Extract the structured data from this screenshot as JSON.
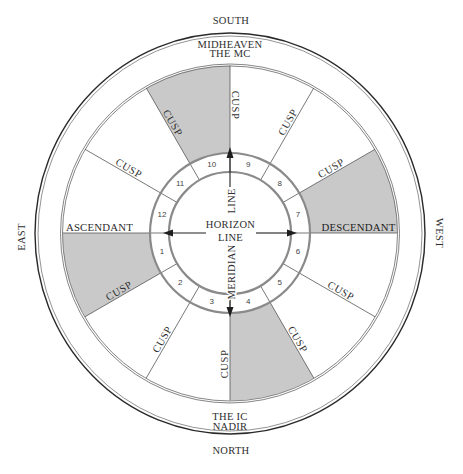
{
  "directions": {
    "south": "SOUTH",
    "north": "NORTH",
    "east": "EAST",
    "west": "WEST"
  },
  "angles": {
    "midheaven": "MIDHEAVEN",
    "the_mc": "THE MC",
    "the_ic": "THE IC",
    "nadir": "NADIR",
    "ascendant": "ASCENDANT",
    "descendant": "DESCENDANT"
  },
  "center": {
    "horizon_line_1": "HORIZON",
    "horizon_line_2": "LINE",
    "meridian_upper": "LINE",
    "meridian_lower": "MERIDIAN"
  },
  "houses": [
    {
      "number": "1",
      "shaded": true
    },
    {
      "number": "2",
      "shaded": false
    },
    {
      "number": "3",
      "shaded": false
    },
    {
      "number": "4",
      "shaded": true
    },
    {
      "number": "5",
      "shaded": false
    },
    {
      "number": "6",
      "shaded": false
    },
    {
      "number": "7",
      "shaded": true
    },
    {
      "number": "8",
      "shaded": false
    },
    {
      "number": "9",
      "shaded": false
    },
    {
      "number": "10",
      "shaded": true
    },
    {
      "number": "11",
      "shaded": false
    },
    {
      "number": "12",
      "shaded": false
    }
  ],
  "cusps": [
    {
      "position": "midheaven-cusp",
      "label": "CUSP"
    },
    {
      "position": "cusp-10-11",
      "label": "CUSP"
    },
    {
      "position": "cusp-11-12",
      "label": "CUSP"
    },
    {
      "position": "cusp-1-2",
      "label": "CUSP"
    },
    {
      "position": "cusp-2-3",
      "label": "CUSP"
    },
    {
      "position": "ic-cusp",
      "label": "CUSP"
    },
    {
      "position": "cusp-4-5",
      "label": "CUSP"
    },
    {
      "position": "cusp-5-6",
      "label": "CUSP"
    },
    {
      "position": "cusp-7-8",
      "label": "CUSP"
    },
    {
      "position": "cusp-8-9",
      "label": "CUSP"
    }
  ],
  "colors": {
    "shade": "#c9c9c9",
    "ring": "#8a8a8a",
    "line": "#555555",
    "text": "#2e2e2e"
  }
}
